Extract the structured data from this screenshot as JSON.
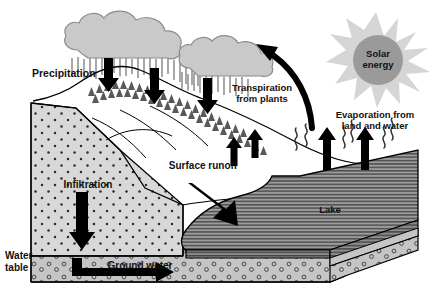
{
  "diagram": {
    "type": "earth-science-illustration",
    "background_color": "#ffffff",
    "width": 441,
    "height": 300
  },
  "labels": {
    "precipitation": "Precipitation",
    "transpiration_line1": "Transpiration",
    "transpiration_line2": "from plants",
    "evaporation_line1": "Evaporation from",
    "evaporation_line2": "land and water",
    "solar_line1": "Solar",
    "solar_line2": "energy",
    "surface_runoff": "Surface runoff",
    "infiltration": "Infiltration",
    "ground_water": "Ground water",
    "water_table_line1": "Water",
    "water_table_line2": "table",
    "lake": "Lake"
  },
  "colors": {
    "outline": "#000000",
    "text": "#111111",
    "cloud_fill": "#c9c9c9",
    "cloud_stroke": "#8c8c8c",
    "rain_streak": "#6f6f6f",
    "sun_ray_fill": "#d5d5d5",
    "sun_core_fill": "#9a9a9a",
    "soil_fill": "#d8d8d8",
    "soil_dot": "#2b2b2b",
    "aquifer_fill": "#c5c5c5",
    "aquifer_circle": "#3a3a3a",
    "lake_fill": "#9d9d9d",
    "lake_hatch": "#4a4a4a",
    "land_fill": "#ffffff",
    "tree_fill": "#595959",
    "arrow_fill": "#000000",
    "vapor_stroke": "#333333"
  },
  "icons": {
    "cloud_large": "cloud-icon",
    "cloud_small": "cloud-icon",
    "sun": "sun-icon",
    "rain": "rain-streaks-icon",
    "arrow_down": "arrow-down-icon",
    "arrow_up": "arrow-up-icon",
    "arrow_curved": "curved-arrow-icon",
    "arrow_diagonal": "arrow-diagonal-icon",
    "arrow_right": "arrow-right-icon",
    "vapor": "vapor-squiggle-icon",
    "tree": "tree-icon"
  },
  "processes": [
    {
      "name": "Precipitation",
      "direction": "downward",
      "region": "mountain"
    },
    {
      "name": "Transpiration from plants",
      "direction": "upward",
      "region": "forest"
    },
    {
      "name": "Evaporation from land and water",
      "direction": "upward",
      "region": "lake"
    },
    {
      "name": "Surface runoff",
      "direction": "downslope",
      "region": "hillside"
    },
    {
      "name": "Infiltration",
      "direction": "downward",
      "region": "soil"
    },
    {
      "name": "Ground water",
      "direction": "lateral",
      "region": "aquifer"
    }
  ]
}
